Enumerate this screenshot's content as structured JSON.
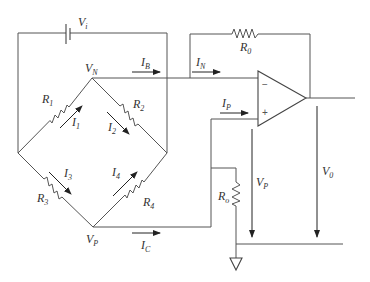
{
  "diagram": {
    "type": "circuit",
    "labels": {
      "Vi": {
        "main": "V",
        "sub": "i"
      },
      "VN": {
        "main": "V",
        "sub": "N"
      },
      "VP": {
        "main": "V",
        "sub": "P"
      },
      "VP_out": {
        "main": "V",
        "sub": "P"
      },
      "V0": {
        "main": "V",
        "sub": "0"
      },
      "R0": {
        "main": "R",
        "sub": "0"
      },
      "Ro": {
        "main": "R",
        "sub": "o"
      },
      "R1": {
        "main": "R",
        "sub": "1"
      },
      "R2": {
        "main": "R",
        "sub": "2"
      },
      "R3": {
        "main": "R",
        "sub": "3"
      },
      "R4": {
        "main": "R",
        "sub": "4"
      },
      "I1": {
        "main": "I",
        "sub": "1"
      },
      "I2": {
        "main": "I",
        "sub": "2"
      },
      "I3": {
        "main": "I",
        "sub": "3"
      },
      "I4": {
        "main": "I",
        "sub": "4"
      },
      "IB": {
        "main": "I",
        "sub": "B"
      },
      "IN": {
        "main": "I",
        "sub": "N"
      },
      "IP": {
        "main": "I",
        "sub": "P"
      },
      "IC": {
        "main": "I",
        "sub": "C"
      }
    },
    "opamp": {
      "minus": "−",
      "plus": "+"
    }
  }
}
